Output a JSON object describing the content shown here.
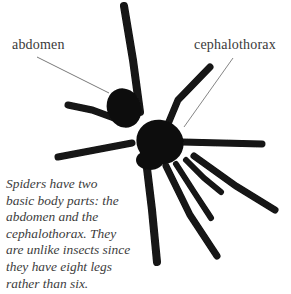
{
  "labels": {
    "abdomen": "abdomen",
    "cephalothorax": "cephalothorax"
  },
  "caption": {
    "lines": [
      "Spiders have two",
      "basic body parts: the",
      "abdomen and the",
      "cephalothorax. They",
      "are unlike insects since",
      "they have eight legs",
      "rather than six."
    ]
  },
  "illustration": {
    "subject": "spider-photo",
    "body_color": "#111111",
    "leader_line_color": "#555555"
  }
}
